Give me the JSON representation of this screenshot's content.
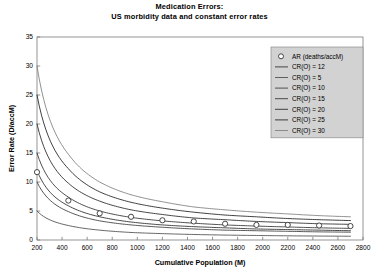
{
  "chart_data": {
    "type": "line",
    "title": "Medication Errors:",
    "subtitle": "US morbidity data and constant error rates",
    "xlabel": "Cumulative Population (M)",
    "ylabel": "Error Rate (D/accM)",
    "xlim": [
      200,
      2800
    ],
    "ylim": [
      0,
      35
    ],
    "xticks": [
      200,
      400,
      600,
      800,
      1000,
      1200,
      1400,
      1600,
      1800,
      2000,
      2200,
      2400,
      2600,
      2800
    ],
    "yticks": [
      0,
      5,
      10,
      15,
      20,
      25,
      30,
      35
    ],
    "grid": false,
    "legend_position": "top-right",
    "x": [
      200,
      450,
      700,
      950,
      1200,
      1450,
      1700,
      1950,
      2200,
      2450,
      2700
    ],
    "scatter_series": {
      "name": "AR (deaths/accM)",
      "marker": "open-circle",
      "color": "#333333",
      "values": [
        11.7,
        6.8,
        4.6,
        4.0,
        3.4,
        3.2,
        2.8,
        2.6,
        2.6,
        2.5,
        2.4
      ]
    },
    "series": [
      {
        "name": "CR(O) = 12",
        "level": 12,
        "color": "#2b2b2b",
        "width": 0.85,
        "values": [
          12.0,
          5.9,
          4.0,
          3.1,
          2.6,
          2.3,
          2.1,
          1.9,
          1.8,
          1.7,
          1.6
        ]
      },
      {
        "name": "CR(O) = 5",
        "level": 5,
        "color": "#4a4a4a",
        "width": 0.85,
        "values": [
          5.0,
          2.5,
          1.7,
          1.3,
          1.1,
          0.95,
          0.85,
          0.78,
          0.72,
          0.68,
          0.65
        ]
      },
      {
        "name": "CR(O) = 10",
        "level": 10,
        "color": "#3a3a3a",
        "width": 0.85,
        "values": [
          10.0,
          4.9,
          3.3,
          2.6,
          2.2,
          1.9,
          1.7,
          1.6,
          1.5,
          1.4,
          1.35
        ]
      },
      {
        "name": "CR(O) = 15",
        "level": 15,
        "color": "#303030",
        "width": 0.85,
        "values": [
          15.0,
          7.4,
          5.0,
          3.9,
          3.3,
          2.9,
          2.6,
          2.4,
          2.25,
          2.1,
          2.0
        ]
      },
      {
        "name": "CR(O) = 20",
        "level": 20,
        "color": "#262626",
        "width": 0.85,
        "values": [
          20.0,
          9.8,
          6.7,
          5.2,
          4.4,
          3.8,
          3.5,
          3.2,
          3.0,
          2.8,
          2.7
        ]
      },
      {
        "name": "CR(O) = 25",
        "level": 25,
        "color": "#1f1f1f",
        "width": 0.85,
        "values": [
          25.0,
          12.3,
          8.3,
          6.5,
          5.5,
          4.8,
          4.3,
          4.0,
          3.7,
          3.5,
          3.35
        ]
      },
      {
        "name": "CR(O) = 30",
        "level": 30,
        "color": "#7d7d7d",
        "width": 0.85,
        "values": [
          30.0,
          14.8,
          10.0,
          7.8,
          6.6,
          5.7,
          5.2,
          4.8,
          4.5,
          4.2,
          4.0
        ]
      }
    ]
  },
  "legend": {
    "entries": [
      {
        "label": "AR (deaths/accM)",
        "kind": "marker"
      },
      {
        "label": "CR(O) = 12",
        "kind": "line"
      },
      {
        "label": "CR(O) = 5",
        "kind": "line"
      },
      {
        "label": "CR(O) = 10",
        "kind": "line"
      },
      {
        "label": "CR(O) = 15",
        "kind": "line"
      },
      {
        "label": "CR(O) = 20",
        "kind": "line"
      },
      {
        "label": "CR(O) = 25",
        "kind": "line"
      },
      {
        "label": "CR(O) = 30",
        "kind": "line"
      }
    ],
    "background": "#d2d2d2",
    "border": "#8c8c8c"
  },
  "style": {
    "background": "#ffffff",
    "axis_color": "#7a7a7a",
    "text_color": "#000000"
  }
}
